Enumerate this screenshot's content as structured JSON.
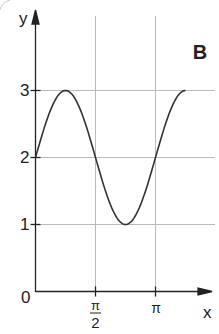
{
  "chart_data": {
    "type": "line",
    "title": "",
    "panel_label": "B",
    "xlabel": "x",
    "ylabel": "y",
    "function": "y = 2 + sin(2x)",
    "x_ticks": [
      {
        "value": 1.5708,
        "label_num": "π",
        "label_den": "2"
      },
      {
        "value": 3.1416,
        "label": "π"
      }
    ],
    "y_ticks": [
      {
        "value": 1,
        "label": "1"
      },
      {
        "value": 2,
        "label": "2"
      },
      {
        "value": 3,
        "label": "3"
      }
    ],
    "origin_label": "0",
    "xlim": [
      0,
      3.93
    ],
    "ylim": [
      0,
      3
    ],
    "grid": true,
    "series": [
      {
        "name": "curve",
        "x": [
          0,
          0.3927,
          0.7854,
          1.1781,
          1.5708,
          1.9635,
          2.3562,
          2.7489,
          3.1416,
          3.5343,
          3.927
        ],
        "values": [
          2,
          2.707,
          3,
          2.707,
          2,
          1.293,
          1,
          1.293,
          2,
          2.707,
          3
        ]
      }
    ],
    "colors": {
      "curve": "#333333",
      "axis": "#222222",
      "grid": "#bbbbbb"
    }
  }
}
